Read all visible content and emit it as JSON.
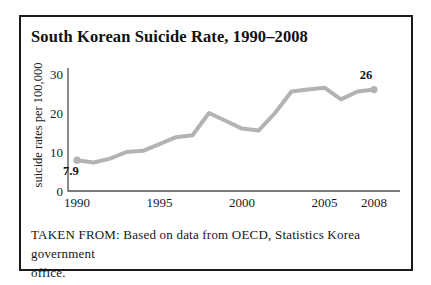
{
  "figure": {
    "caption_lines": [
      "TAKEN FROM: Based on data from OECD, Statistics Korea government",
      "office."
    ]
  },
  "chart_data": {
    "type": "line",
    "title": "South Korean Suicide Rate, 1990–2008",
    "xlabel": "",
    "ylabel": "suicide rates per 100,000",
    "x": [
      1990,
      1991,
      1992,
      1993,
      1994,
      1995,
      1996,
      1997,
      1998,
      1999,
      2000,
      2001,
      2002,
      2003,
      2004,
      2005,
      2006,
      2007,
      2008
    ],
    "values": [
      7.9,
      7.3,
      8.3,
      10.0,
      10.3,
      12.0,
      13.8,
      14.3,
      20.0,
      18.0,
      16.0,
      15.5,
      20.0,
      25.5,
      26.0,
      26.5,
      23.5,
      25.5,
      26.0
    ],
    "x_ticks": [
      1990,
      1995,
      2000,
      2005,
      2008
    ],
    "y_ticks": [
      0,
      10,
      20,
      30
    ],
    "xlim": [
      1990,
      2008
    ],
    "ylim": [
      0,
      30
    ],
    "grid": false,
    "legend": "none",
    "line_color": "#b3b3b3",
    "axis_color": "#4f4f4f",
    "text_color": "#1a1a1a",
    "markers": "endpoints",
    "annotations": [
      {
        "x": 1990,
        "y": 7.9,
        "label": "7.9",
        "position": "below-left"
      },
      {
        "x": 2008,
        "y": 26.0,
        "label": "26",
        "position": "above"
      }
    ]
  }
}
